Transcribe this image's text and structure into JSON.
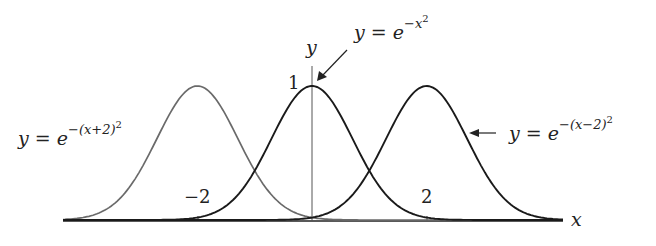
{
  "chart_data": {
    "type": "line",
    "title": "",
    "xlabel": "x",
    "ylabel": "y",
    "xlim": [
      -4.4,
      4.4
    ],
    "ylim": [
      0,
      1
    ],
    "grid": false,
    "legend": null,
    "x_ticks": [
      {
        "value": -2,
        "label": "−2"
      },
      {
        "value": 2,
        "label": "2"
      }
    ],
    "y_ticks": [
      {
        "value": 1,
        "label": "1"
      }
    ],
    "series": [
      {
        "name": "y = e^{-(x+2)^2}",
        "shift": -2,
        "color": "#6a6a6a",
        "label": {
          "base": "y = e",
          "sup": "−(x+2)",
          "sup2": "2"
        }
      },
      {
        "name": "y = e^{-x^2}",
        "shift": 0,
        "color": "#1a1a1a",
        "label": {
          "base": "y = e",
          "sup": "−x",
          "sup2": "2"
        }
      },
      {
        "name": "y = e^{-(x-2)^2}",
        "shift": 2,
        "color": "#1a1a1a",
        "label": {
          "base": "y = e",
          "sup": "−(x−2)",
          "sup2": "2"
        }
      }
    ],
    "annotations": [
      {
        "text": "y = e^{-x^2}",
        "arrow_to": [
          0.1,
          0.95
        ]
      },
      {
        "text": "y = e^{-(x-2)^2}",
        "arrow_to": [
          2.75,
          0.66
        ]
      }
    ]
  },
  "labels": {
    "x_axis": "x",
    "y_axis": "y",
    "tick_neg2": "−2",
    "tick_pos2": "2",
    "tick_one": "1",
    "left_base": "y = e",
    "left_sup": "−(x+2)",
    "left_sup2": "2",
    "center_base": "y = e",
    "center_sup": "−x",
    "center_sup2": "2",
    "right_base": "y = e",
    "right_sup": "−(x−2)",
    "right_sup2": "2"
  }
}
